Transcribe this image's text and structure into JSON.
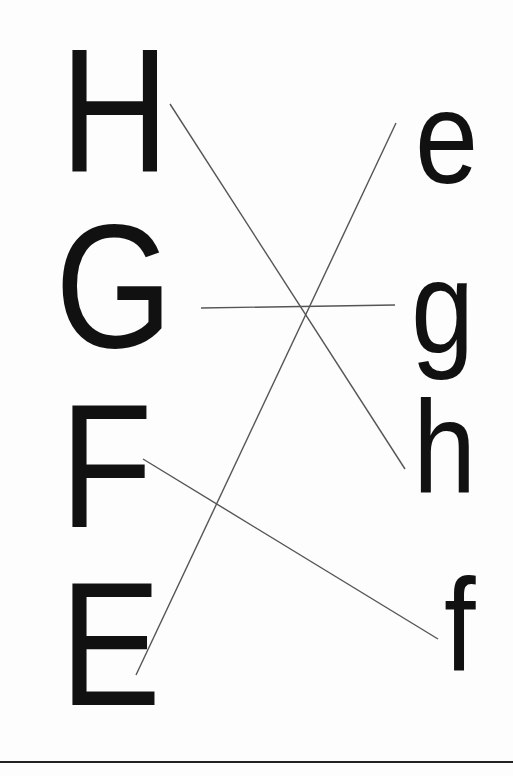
{
  "worksheet": {
    "title": "Match uppercase to lowercase letters",
    "uppercase": [
      {
        "id": "H",
        "label": "H",
        "x": 60,
        "y": 22
      },
      {
        "id": "G",
        "label": "G",
        "x": 55,
        "y": 198
      },
      {
        "id": "F",
        "label": "F",
        "x": 60,
        "y": 378
      },
      {
        "id": "E",
        "label": "E",
        "x": 60,
        "y": 556
      }
    ],
    "lowercase": [
      {
        "id": "e",
        "label": "e",
        "x": 415,
        "y": 72
      },
      {
        "id": "g",
        "label": "g",
        "x": 411,
        "y": 242
      },
      {
        "id": "h",
        "label": "h",
        "x": 413,
        "y": 382
      },
      {
        "id": "f",
        "label": "f",
        "x": 444,
        "y": 560
      }
    ],
    "connections": [
      {
        "from": "H",
        "to": "h",
        "x1": 170,
        "y1": 104,
        "x2": 405,
        "y2": 469
      },
      {
        "from": "G",
        "to": "g",
        "x1": 201,
        "y1": 308,
        "x2": 395,
        "y2": 305
      },
      {
        "from": "E",
        "to": "e",
        "x1": 136,
        "y1": 675,
        "x2": 396,
        "y2": 123
      },
      {
        "from": "F",
        "to": "f",
        "x1": 143,
        "y1": 459,
        "x2": 438,
        "y2": 639
      }
    ],
    "colors": {
      "letter": "#111111",
      "line": "#555555",
      "rule": "#222222",
      "background": "#fdfdfd"
    }
  }
}
